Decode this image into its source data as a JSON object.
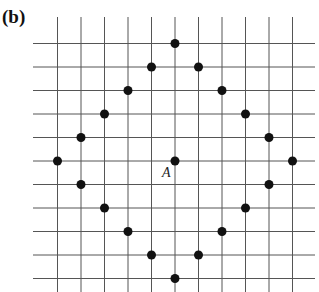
{
  "panel": {
    "label": "(b)",
    "top_text_fragment": "y"
  },
  "grid": {
    "columns": 11,
    "rows": 11,
    "origin_px": [
      175,
      161
    ],
    "spacing_px": 23.5,
    "x_line_extent": [
      33,
      315
    ],
    "y_line_extent": [
      17,
      292
    ],
    "line_color": "#555555",
    "dot_color": "#111111"
  },
  "center_point": {
    "label": "A",
    "x": 0,
    "y": 0
  },
  "points": [
    [
      0,
      5
    ],
    [
      1,
      4
    ],
    [
      2,
      3
    ],
    [
      3,
      2
    ],
    [
      4,
      1
    ],
    [
      5,
      0
    ],
    [
      4,
      -1
    ],
    [
      3,
      -2
    ],
    [
      2,
      -3
    ],
    [
      1,
      -4
    ],
    [
      0,
      -5
    ],
    [
      -1,
      -4
    ],
    [
      -2,
      -3
    ],
    [
      -3,
      -2
    ],
    [
      -4,
      -1
    ],
    [
      -5,
      0
    ],
    [
      -4,
      1
    ],
    [
      -3,
      2
    ],
    [
      -2,
      3
    ],
    [
      -1,
      4
    ]
  ]
}
